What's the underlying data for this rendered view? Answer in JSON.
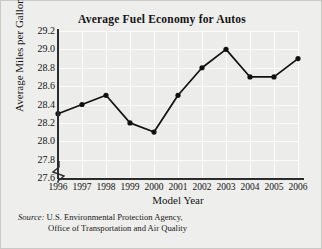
{
  "figure": {
    "title": "Average Fuel Economy for Autos",
    "source_label": "Source:",
    "source_line1": "U.S. Environmental Protection Agency,",
    "source_line2": "Office of Transportation and Air Quality"
  },
  "colors": {
    "page_background": "#eeeeec",
    "plot_background": "#ececeb",
    "gridline": "#fbfbfa",
    "axis": "#2b2b2b",
    "series": "#111111",
    "border": "#c9c9c5"
  },
  "chart_data": {
    "type": "line",
    "title": "Average Fuel Economy for Autos",
    "xlabel": "Model Year",
    "ylabel": "Average Miles per Gallon",
    "categories": [
      "1996",
      "1997",
      "1998",
      "1999",
      "2000",
      "2001",
      "2002",
      "2003",
      "2004",
      "2005",
      "2006"
    ],
    "values": [
      28.3,
      28.4,
      28.5,
      28.2,
      28.1,
      28.5,
      28.8,
      29.0,
      28.7,
      28.7,
      28.9
    ],
    "ylim": [
      27.6,
      29.2
    ],
    "yticks": [
      "29.2",
      "29.0",
      "28.8",
      "28.6",
      "28.4",
      "28.2",
      "28.0",
      "27.8",
      "27.6"
    ],
    "ytick_values": [
      29.2,
      29.0,
      28.8,
      28.6,
      28.4,
      28.2,
      28.0,
      27.8,
      27.6
    ],
    "ytick_step": 0.2,
    "axis_break": true,
    "grid": true,
    "legend": "none",
    "marker": "filled-circle",
    "series": [
      {
        "name": "Average Miles per Gallon",
        "values": [
          28.3,
          28.4,
          28.5,
          28.2,
          28.1,
          28.5,
          28.8,
          29.0,
          28.7,
          28.7,
          28.9
        ]
      }
    ]
  }
}
